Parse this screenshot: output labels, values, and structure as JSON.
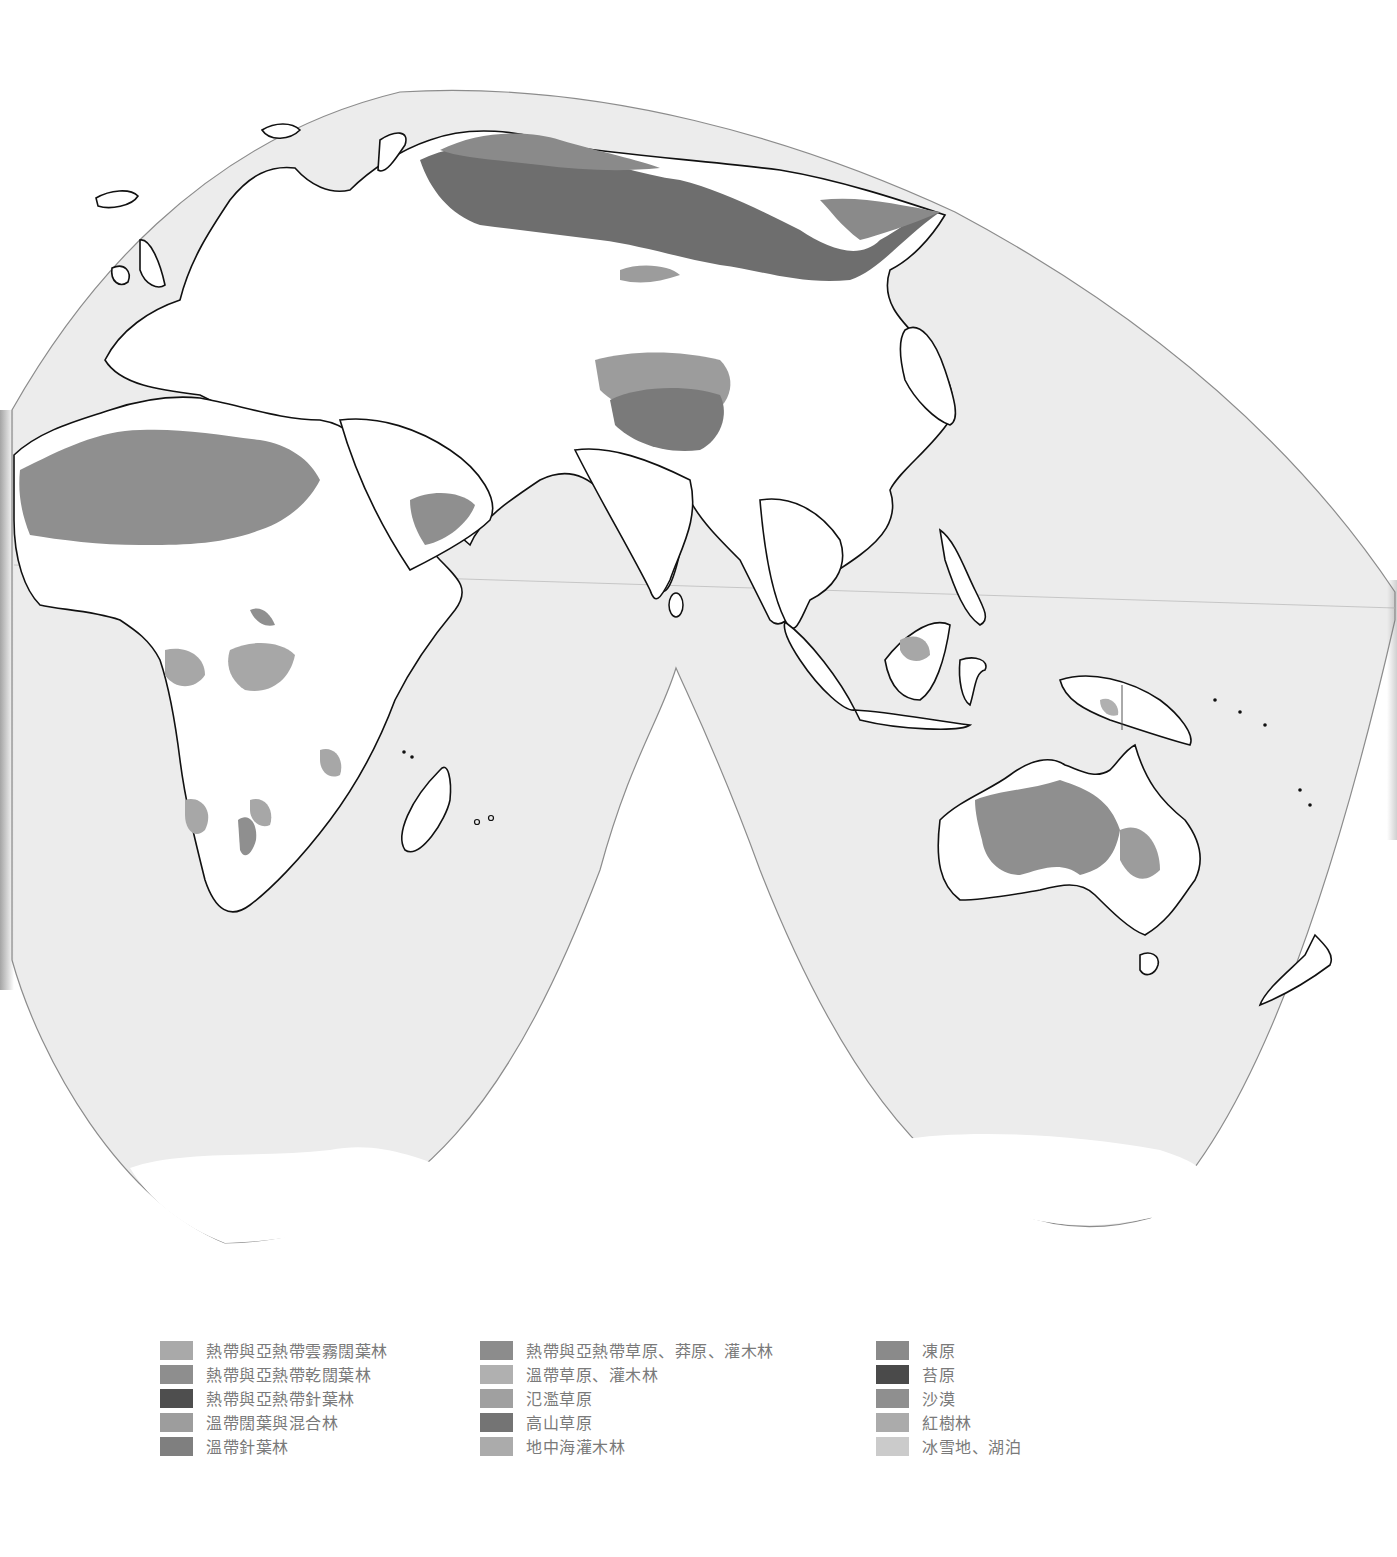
{
  "map": {
    "projection": "interrupted-pseudocylindrical (Eastern Hemisphere)",
    "colors": {
      "ocean": "#ececec",
      "land_unclassified": "#ffffff",
      "outline": "#8c8c8c",
      "border": "#111111",
      "desert": "#8f8f8f",
      "temperate_coniferous": "#7a7a7a",
      "tundra": "#9a9a9a",
      "tropical_grassland": "#a7a7a7",
      "temperate_grassland": "#b2b2b2",
      "ice": "#ffffff"
    }
  },
  "legend": {
    "columns": [
      {
        "items": [
          {
            "label": "熱帶與亞熱帶雲霧闊葉林",
            "color": "#a9a9a9"
          },
          {
            "label": "熱帶與亞熱帶乾闊葉林",
            "color": "#8e8e8e"
          },
          {
            "label": "熱帶與亞熱帶針葉林",
            "color": "#4e4e4e"
          },
          {
            "label": "溫帶闊葉與混合林",
            "color": "#9d9d9d"
          },
          {
            "label": "溫帶針葉林",
            "color": "#7f7f7f"
          }
        ]
      },
      {
        "items": [
          {
            "label": "熱帶與亞熱帶草原、莽原、灌木林",
            "color": "#8c8c8c"
          },
          {
            "label": "溫帶草原、灌木林",
            "color": "#b0b0b0"
          },
          {
            "label": "氾濫草原",
            "color": "#a0a0a0"
          },
          {
            "label": "高山草原",
            "color": "#747474"
          },
          {
            "label": "地中海灌木林",
            "color": "#ababab"
          }
        ]
      },
      {
        "items": [
          {
            "label": "凍原",
            "color": "#8a8a8a"
          },
          {
            "label": "苔原",
            "color": "#4a4a4a"
          },
          {
            "label": "沙漠",
            "color": "#8f8f8f"
          },
          {
            "label": "紅樹林",
            "color": "#ababab"
          },
          {
            "label": "冰雪地、湖泊",
            "color": "#cbcbcb"
          }
        ]
      }
    ]
  }
}
